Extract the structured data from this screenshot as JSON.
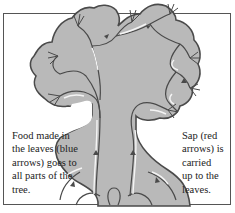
{
  "diagram": {
    "subject": "tree",
    "colors": {
      "fill": "#b9b9b9",
      "outline": "#4a4a4a",
      "vessel_highlight": "#f4f4f4",
      "frame": "#555555",
      "text": "#222222"
    },
    "captions": {
      "left": "Food made in\nthe leaves (blue\narrows) goes to\nall parts of the\ntree.",
      "right": "Sap (red\narrows) is\ncarried\nup to the\nleaves."
    },
    "labels": {
      "food_flow": "Food made in the leaves (blue arrows) goes to all parts of the tree.",
      "sap_flow": "Sap (red arrows) is carried up to the leaves."
    }
  }
}
